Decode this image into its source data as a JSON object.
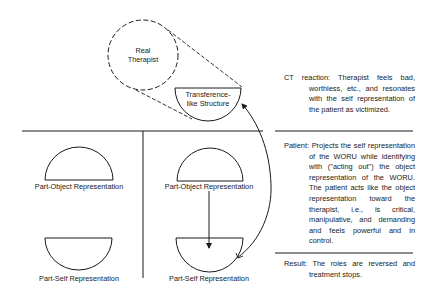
{
  "diagram": {
    "real_therapist": {
      "line1": "Real",
      "line2": "Therapist"
    },
    "transference": {
      "line1": "Transference-",
      "line2": "like Structure"
    },
    "left_column": {
      "object_label": "Part-Object Representation",
      "self_label": "Part-Self Representation"
    },
    "right_column": {
      "object_label": "Part-Object Representation",
      "self_label": "Part-Self Representation"
    }
  },
  "notes": {
    "ct_reaction": {
      "head": "CT reaction:",
      "text": "Therapist feels bad, worthless, etc., and resonates with the self representation of the patient as victimized."
    },
    "patient": {
      "head": "Patient:",
      "text": "Projects the self representation of the WORU while identifying with (\"acting out\") the object representation of the WORU. The patient acts like the object representation toward the therapist, i.e., is critical, manipulative, and demanding and feels powerful and in control."
    },
    "result": {
      "head": "Result:",
      "text": "The roles are reversed and treatment stops."
    }
  },
  "colors": {
    "ink": "#1a1a1a",
    "background": "#ffffff"
  }
}
